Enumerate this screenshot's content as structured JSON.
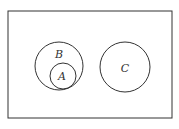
{
  "diagram": {
    "type": "venn",
    "universe": {
      "x": 8,
      "y": 11,
      "w": 164,
      "h": 107
    },
    "sets": [
      {
        "label": "B",
        "cx": 59,
        "cy": 66,
        "r": 24,
        "lx": 59,
        "ly": 58
      },
      {
        "label": "A",
        "cx": 63,
        "cy": 76,
        "r": 13,
        "lx": 62,
        "ly": 80
      },
      {
        "label": "C",
        "cx": 125,
        "cy": 67,
        "r": 25,
        "lx": 125,
        "ly": 72
      }
    ],
    "relations": [
      "A subset of B",
      "C disjoint from B"
    ],
    "stroke": "#333333"
  }
}
